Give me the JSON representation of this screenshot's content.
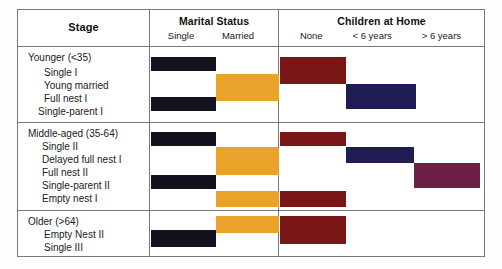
{
  "header": {
    "columns": [
      {
        "title": "Stage",
        "subs": []
      },
      {
        "title": "Marital Status",
        "subs": [
          "Single",
          "Married"
        ]
      },
      {
        "title": "Children at Home",
        "subs": [
          "None",
          "< 6 years",
          "> 6 years"
        ]
      }
    ]
  },
  "colors": {
    "black": "#12121f",
    "orange": "#eaa22b",
    "darkred": "#7b1616",
    "navy": "#1e1e54",
    "purple": "#6d2043",
    "rule": "#7a7a7a",
    "text": "#1a1a1a"
  },
  "chart_data": {
    "type": "table",
    "column_headers": [
      "Stage",
      "Marital Status",
      "Children at Home"
    ],
    "sub_headers": {
      "Marital Status": [
        "Single",
        "Married"
      ],
      "Children at Home": [
        "None",
        "< 6 years",
        "> 6 years"
      ]
    },
    "sections": [
      {
        "group": "Younger (<35)",
        "rows": [
          {
            "label": "Single I",
            "marital": "Single",
            "children": "None"
          },
          {
            "label": "Young married",
            "marital": "Married",
            "children": "None"
          },
          {
            "label": "Full nest I",
            "marital": "Married",
            "children": "< 6 years"
          },
          {
            "label": "Single-parent I",
            "marital": "Single",
            "children": "< 6 years"
          }
        ]
      },
      {
        "group": "Middle-aged (35-64)",
        "rows": [
          {
            "label": "Single II",
            "marital": "Single",
            "children": "None"
          },
          {
            "label": "Delayed full nest I",
            "marital": "Married",
            "children": "< 6 years"
          },
          {
            "label": "Full nest II",
            "marital": "Married",
            "children": "> 6 years"
          },
          {
            "label": "Single-parent II",
            "marital": "Single",
            "children": "> 6 years"
          },
          {
            "label": "Empty nest I",
            "marital": "Married",
            "children": "None"
          }
        ]
      },
      {
        "group": "Older (>64)",
        "rows": [
          {
            "label": "Empty Nest II",
            "marital": "Married",
            "children": "None"
          },
          {
            "label": "Single III",
            "marital": "Single",
            "children": "None"
          }
        ]
      }
    ]
  },
  "sections": [
    {
      "group_label": "Younger (<35)",
      "labels": [
        "Single I",
        "Young married",
        "Full nest I",
        "Single-parent I"
      ],
      "bars": [
        {
          "name": "bar-single-black",
          "color": "black",
          "x": 133,
          "y": 10,
          "w": 65,
          "h": 14
        },
        {
          "name": "bar-married-orange",
          "color": "orange",
          "x": 198,
          "y": 27,
          "w": 63,
          "h": 27
        },
        {
          "name": "bar-none-darkred",
          "color": "darkred",
          "x": 262,
          "y": 10,
          "w": 66,
          "h": 27
        },
        {
          "name": "bar-under6-navy",
          "color": "navy",
          "x": 328,
          "y": 37,
          "w": 70,
          "h": 25
        },
        {
          "name": "bar-single-black-2",
          "color": "black",
          "x": 133,
          "y": 50,
          "w": 65,
          "h": 14
        }
      ]
    },
    {
      "group_label": "Middle-aged (35-64)",
      "labels": [
        "Single II",
        "Delayed full nest I",
        "Full nest II",
        "Single-parent II",
        "Empty nest I"
      ],
      "bars": [
        {
          "name": "bar-single-black",
          "color": "black",
          "x": 133,
          "y": 9,
          "w": 65,
          "h": 14
        },
        {
          "name": "bar-married-orange",
          "color": "orange",
          "x": 198,
          "y": 24,
          "w": 63,
          "h": 28
        },
        {
          "name": "bar-none-darkred",
          "color": "darkred",
          "x": 262,
          "y": 9,
          "w": 66,
          "h": 14
        },
        {
          "name": "bar-under6-navy",
          "color": "navy",
          "x": 328,
          "y": 24,
          "w": 68,
          "h": 16
        },
        {
          "name": "bar-over6-purple",
          "color": "purple",
          "x": 396,
          "y": 40,
          "w": 66,
          "h": 25
        },
        {
          "name": "bar-single-black-2",
          "color": "black",
          "x": 133,
          "y": 52,
          "w": 65,
          "h": 14
        },
        {
          "name": "bar-married-orange-2",
          "color": "orange",
          "x": 198,
          "y": 68,
          "w": 63,
          "h": 16
        },
        {
          "name": "bar-none-darkred-2",
          "color": "darkred",
          "x": 262,
          "y": 68,
          "w": 66,
          "h": 16
        }
      ]
    },
    {
      "group_label": "Older (>64)",
      "labels": [
        "Empty Nest II",
        "Single III"
      ],
      "bars": [
        {
          "name": "bar-married-orange",
          "color": "orange",
          "x": 198,
          "y": 5,
          "w": 63,
          "h": 17
        },
        {
          "name": "bar-none-darkred",
          "color": "darkred",
          "x": 262,
          "y": 5,
          "w": 66,
          "h": 28
        },
        {
          "name": "bar-single-black",
          "color": "black",
          "x": 133,
          "y": 19,
          "w": 65,
          "h": 17
        }
      ]
    }
  ],
  "label_offsets": {
    "sec0": [
      4,
      19,
      32,
      45,
      58
    ],
    "sec1": [
      4,
      17,
      30,
      43,
      56,
      69
    ],
    "sec2": [
      4,
      17,
      30
    ]
  }
}
